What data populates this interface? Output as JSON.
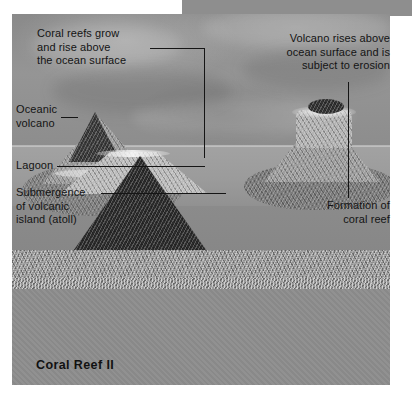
{
  "figure": {
    "title": "Coral Reef II",
    "palette": {
      "plate_gray": "#8e8e8e",
      "sky_gray": "#959595",
      "water_upper": "#a2a2a2",
      "water_lower": "#878787",
      "basement": "#8d8d8d",
      "ink": "#141414",
      "page_white": "#ffffff"
    }
  },
  "annotations": [
    {
      "id": "coral-reefs-grow",
      "text": "Coral reefs grow\nand rise above\nthe ocean surface",
      "align": "left",
      "points_to": "center-volcano-reef-ring"
    },
    {
      "id": "volcano-rises-above",
      "text": "Volcano rises above\nocean surface and is\nsubject to erosion",
      "align": "right",
      "points_to": "right-volcano-crater"
    },
    {
      "id": "oceanic-volcano",
      "text": "Oceanic\nvolcano",
      "align": "left",
      "points_to": "left-volcano-peak"
    },
    {
      "id": "lagoon",
      "text": "Lagoon",
      "align": "left",
      "points_to": "left-volcano-lagoon"
    },
    {
      "id": "submergence",
      "text": "Submergence\nof volcanic\nisland (atoll)",
      "align": "left",
      "points_to": "left-volcano-submerged-flank"
    },
    {
      "id": "formation-of-coral-reef",
      "text": "Formation of\ncoral reef",
      "align": "right",
      "points_to": "right-volcano-reef-base"
    }
  ],
  "scene": {
    "features": [
      {
        "id": "ocean-surface",
        "label": "ocean surface"
      },
      {
        "id": "left-volcano",
        "label": "submerged oceanic volcano with lagoon"
      },
      {
        "id": "center-volcano",
        "label": "emergent volcanic cone with fringing reef"
      },
      {
        "id": "right-volcano",
        "label": "eroded volcano with coral reef platform"
      },
      {
        "id": "sea-floor",
        "label": "sea floor"
      }
    ]
  }
}
